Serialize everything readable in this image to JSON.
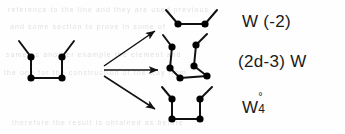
{
  "figure": {
    "kind": "graph-expansion-diagram",
    "width": 345,
    "height": 134,
    "background_color": "#fefefe",
    "ink_color": "#111111",
    "node_color": "#000000",
    "node_radius": 2.8,
    "edge_stroke_width": 2.0,
    "arrow_stroke_width": 1.5
  },
  "source": {
    "name": "source-graph",
    "description": "U-shaped graph: two bottom nodes joined by a horizontal edge, two vertical edges rising to two upper nodes, each upper node carrying a diagonal pendant edge angled outward",
    "node_count": 4,
    "pendant_count": 2,
    "nodes": [
      {
        "id": "bl",
        "x": 31,
        "y": 78
      },
      {
        "id": "br",
        "x": 62,
        "y": 78
      },
      {
        "id": "tl",
        "x": 31,
        "y": 57
      },
      {
        "id": "tr",
        "x": 62,
        "y": 57
      }
    ],
    "edges": [
      {
        "from": [
          31,
          78
        ],
        "to": [
          62,
          78
        ]
      },
      {
        "from": [
          31,
          78
        ],
        "to": [
          31,
          57
        ]
      },
      {
        "from": [
          62,
          78
        ],
        "to": [
          62,
          57
        ]
      }
    ],
    "pendants": [
      {
        "from": [
          31,
          57
        ],
        "to": [
          19,
          41
        ]
      },
      {
        "from": [
          62,
          57
        ],
        "to": [
          74,
          41
        ]
      }
    ]
  },
  "arrows": [
    {
      "name": "arrow-top",
      "from": [
        104,
        66
      ],
      "to": [
        158,
        30
      ],
      "target": "result-top"
    },
    {
      "name": "arrow-middle",
      "from": [
        104,
        70
      ],
      "to": [
        161,
        70
      ],
      "target": "result-middle"
    },
    {
      "name": "arrow-bottom",
      "from": [
        104,
        76
      ],
      "to": [
        158,
        110
      ],
      "target": "result-bottom"
    }
  ],
  "results": [
    {
      "name": "result-top",
      "description": "Two nodes joined by a horizontal edge, each carrying a diagonal pendant edge angled upward and outward",
      "node_count": 2,
      "nodes": [
        {
          "id": "t1",
          "x": 178,
          "y": 24
        },
        {
          "id": "t2",
          "x": 205,
          "y": 24
        }
      ],
      "edges": [
        {
          "from": [
            178,
            24
          ],
          "to": [
            205,
            24
          ]
        }
      ],
      "pendants": [
        {
          "from": [
            178,
            24
          ],
          "to": [
            166,
            10
          ]
        },
        {
          "from": [
            205,
            24
          ],
          "to": [
            217,
            10
          ]
        }
      ],
      "label": {
        "name": "label-w-minus-2",
        "text": "W (-2)",
        "x": 242,
        "y": 13
      }
    },
    {
      "name": "result-middle",
      "description": "Two staggered legs: left leg has an upper node and a lower node, right leg has an upper node and a lower node, the two lower nodes connect down to a pair of bottom nodes joined by a horizontal edge, forming a zigzag; each upper node carries a diagonal pendant",
      "node_count": 6,
      "nodes": [
        {
          "id": "m1",
          "x": 172,
          "y": 47
        },
        {
          "id": "m2",
          "x": 196,
          "y": 45
        },
        {
          "id": "m3",
          "x": 170,
          "y": 68
        },
        {
          "id": "m4",
          "x": 194,
          "y": 66
        },
        {
          "id": "m5",
          "x": 180,
          "y": 78
        },
        {
          "id": "m6",
          "x": 207,
          "y": 76
        }
      ],
      "edges": [
        {
          "from": [
            172,
            47
          ],
          "to": [
            170,
            68
          ]
        },
        {
          "from": [
            196,
            45
          ],
          "to": [
            194,
            66
          ]
        },
        {
          "from": [
            170,
            68
          ],
          "to": [
            180,
            78
          ]
        },
        {
          "from": [
            180,
            78
          ],
          "to": [
            207,
            76
          ]
        },
        {
          "from": [
            194,
            66
          ],
          "to": [
            207,
            76
          ]
        }
      ],
      "pendants": [
        {
          "from": [
            172,
            47
          ],
          "to": [
            163,
            35
          ]
        },
        {
          "from": [
            196,
            45
          ],
          "to": [
            207,
            34
          ]
        }
      ],
      "label": {
        "name": "label-2d-minus-3-w",
        "text": "(2d-3) W",
        "x": 238,
        "y": 53
      }
    },
    {
      "name": "result-bottom",
      "description": "U-shaped graph identical to the source: two bottom nodes joined by a horizontal edge, two vertical edges rising to two upper nodes, each carrying an outward diagonal pendant",
      "node_count": 4,
      "nodes": [
        {
          "id": "b1",
          "x": 172,
          "y": 119
        },
        {
          "id": "b2",
          "x": 200,
          "y": 119
        },
        {
          "id": "b3",
          "x": 172,
          "y": 99
        },
        {
          "id": "b4",
          "x": 200,
          "y": 99
        }
      ],
      "edges": [
        {
          "from": [
            172,
            119
          ],
          "to": [
            200,
            119
          ]
        },
        {
          "from": [
            172,
            119
          ],
          "to": [
            172,
            99
          ]
        },
        {
          "from": [
            200,
            119
          ],
          "to": [
            200,
            99
          ]
        }
      ],
      "pendants": [
        {
          "from": [
            172,
            99
          ],
          "to": [
            162,
            87
          ]
        },
        {
          "from": [
            200,
            99
          ],
          "to": [
            212,
            87
          ]
        }
      ],
      "label": {
        "name": "label-w-4-circ",
        "base": "W",
        "superscript": "°",
        "subscript": "4",
        "text": "W°4",
        "x": 242,
        "y": 97
      }
    }
  ],
  "ghost_text": {
    "description": "faint bleed-through text from the reverse side of the scanned page",
    "lines": [
      {
        "text": "reference to the line and they are used  previous",
        "x": 8,
        "y": 11
      },
      {
        "text": "and some section to prove in some of",
        "x": 10,
        "y": 28
      },
      {
        "text": "same as  another example  the element  and",
        "x": 6,
        "y": 56
      },
      {
        "text": "the one  for the  construction  of the  way from",
        "x": 4,
        "y": 74
      },
      {
        "text": "therefore the result is obtained as before",
        "x": 12,
        "y": 124
      }
    ]
  }
}
